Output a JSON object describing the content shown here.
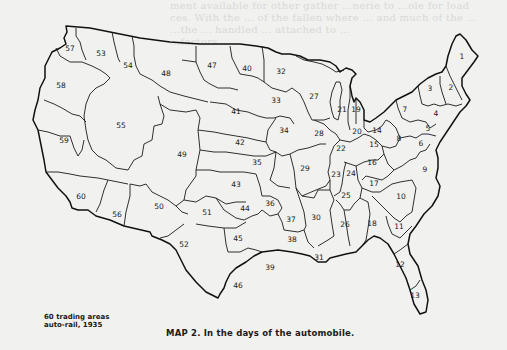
{
  "figure": {
    "caption": "MAP 2. In the days of the automobile.",
    "legend_line1": "60 trading areas",
    "legend_line2": "auto-rail, 1935",
    "background_color": "#f1f1ef",
    "line_color": "#1a1a1a",
    "bleed_through_text": [
      "ment available for other gather ...nerie to ...ole for load",
      "ces. With the ... of the fallen where ... and much of the ...",
      "...the ... handled ... attached to ...",
      "...factors ..."
    ]
  },
  "map": {
    "title": "United States trading areas, auto-rail, 1935",
    "area_count": 60,
    "areas": [
      {
        "id": "1",
        "x": 462,
        "y": 57
      },
      {
        "id": "2",
        "x": 451,
        "y": 88
      },
      {
        "id": "3",
        "x": 430,
        "y": 89
      },
      {
        "id": "4",
        "x": 436,
        "y": 114
      },
      {
        "id": "5",
        "x": 428,
        "y": 129
      },
      {
        "id": "6",
        "x": 421,
        "y": 144
      },
      {
        "id": "7",
        "x": 405,
        "y": 110
      },
      {
        "id": "8",
        "x": 399,
        "y": 139
      },
      {
        "id": "9",
        "x": 425,
        "y": 170
      },
      {
        "id": "10",
        "x": 401,
        "y": 197
      },
      {
        "id": "11",
        "x": 399,
        "y": 227
      },
      {
        "id": "12",
        "x": 400,
        "y": 265
      },
      {
        "id": "13",
        "x": 415,
        "y": 296
      },
      {
        "id": "14",
        "x": 377,
        "y": 131
      },
      {
        "id": "15",
        "x": 374,
        "y": 145
      },
      {
        "id": "16",
        "x": 372,
        "y": 163
      },
      {
        "id": "17",
        "x": 374,
        "y": 184
      },
      {
        "id": "18",
        "x": 372,
        "y": 224
      },
      {
        "id": "19",
        "x": 356,
        "y": 110
      },
      {
        "id": "20",
        "x": 357,
        "y": 132
      },
      {
        "id": "21",
        "x": 342,
        "y": 110
      },
      {
        "id": "22",
        "x": 341,
        "y": 149
      },
      {
        "id": "23",
        "x": 336,
        "y": 175
      },
      {
        "id": "24",
        "x": 351,
        "y": 174
      },
      {
        "id": "25",
        "x": 346,
        "y": 196
      },
      {
        "id": "26",
        "x": 345,
        "y": 225
      },
      {
        "id": "27",
        "x": 314,
        "y": 97
      },
      {
        "id": "28",
        "x": 319,
        "y": 134
      },
      {
        "id": "29",
        "x": 305,
        "y": 169
      },
      {
        "id": "30",
        "x": 316,
        "y": 218
      },
      {
        "id": "31",
        "x": 319,
        "y": 258
      },
      {
        "id": "32",
        "x": 281,
        "y": 72
      },
      {
        "id": "33",
        "x": 276,
        "y": 101
      },
      {
        "id": "34",
        "x": 284,
        "y": 131
      },
      {
        "id": "35",
        "x": 257,
        "y": 163
      },
      {
        "id": "36",
        "x": 270,
        "y": 204
      },
      {
        "id": "37",
        "x": 291,
        "y": 220
      },
      {
        "id": "38",
        "x": 292,
        "y": 240
      },
      {
        "id": "39",
        "x": 270,
        "y": 268
      },
      {
        "id": "40",
        "x": 247,
        "y": 69
      },
      {
        "id": "41",
        "x": 236,
        "y": 112
      },
      {
        "id": "42",
        "x": 240,
        "y": 143
      },
      {
        "id": "43",
        "x": 236,
        "y": 185
      },
      {
        "id": "44",
        "x": 245,
        "y": 209
      },
      {
        "id": "45",
        "x": 238,
        "y": 239
      },
      {
        "id": "46",
        "x": 238,
        "y": 286
      },
      {
        "id": "47",
        "x": 212,
        "y": 66
      },
      {
        "id": "48",
        "x": 166,
        "y": 74
      },
      {
        "id": "49",
        "x": 182,
        "y": 155
      },
      {
        "id": "50",
        "x": 159,
        "y": 207
      },
      {
        "id": "51",
        "x": 207,
        "y": 213
      },
      {
        "id": "52",
        "x": 184,
        "y": 245
      },
      {
        "id": "53",
        "x": 101,
        "y": 54
      },
      {
        "id": "54",
        "x": 128,
        "y": 66
      },
      {
        "id": "55",
        "x": 121,
        "y": 126
      },
      {
        "id": "56",
        "x": 117,
        "y": 215
      },
      {
        "id": "57",
        "x": 70,
        "y": 49
      },
      {
        "id": "58",
        "x": 61,
        "y": 86
      },
      {
        "id": "59",
        "x": 64,
        "y": 141
      },
      {
        "id": "60",
        "x": 81,
        "y": 197
      }
    ]
  }
}
